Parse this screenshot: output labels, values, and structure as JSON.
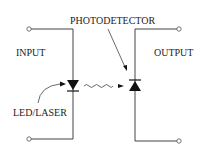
{
  "diagram": {
    "type": "optocoupler-schematic",
    "labels": {
      "input": "INPUT",
      "output": "OUTPUT",
      "emitter": "LED/LASER",
      "detector": "PHOTODETECTOR"
    },
    "components": [
      {
        "name": "LED/LASER",
        "symbol": "diode-pointing-down",
        "side": "input"
      },
      {
        "name": "PHOTODETECTOR",
        "symbol": "diode-pointing-up",
        "side": "output"
      }
    ],
    "connections": [
      {
        "from": "LED/LASER",
        "to": "PHOTODETECTOR",
        "style": "wavy-arrow",
        "meaning": "light"
      }
    ],
    "terminals": 4,
    "colors": {
      "line": "#444444",
      "text": "#222222",
      "fill": "#111111"
    }
  }
}
